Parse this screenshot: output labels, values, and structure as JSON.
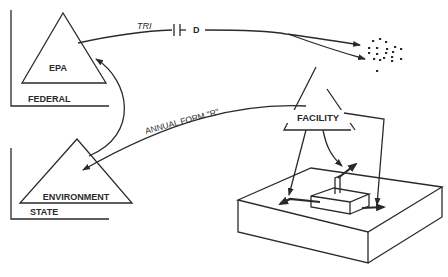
{
  "diagram": {
    "type": "flow-schematic",
    "nodes": {
      "federal": {
        "entity_label": "EPA",
        "level_label": "FEDERAL"
      },
      "state": {
        "entity_label": "ENVIRONMENT",
        "level_label": "STATE"
      },
      "facility": {
        "entity_label": "FACILITY"
      },
      "public": {
        "label": ""
      }
    },
    "edges": {
      "tri": {
        "label": "TRI",
        "suffix": "D",
        "from": "EPA",
        "to": "public (dots)"
      },
      "annual_form": {
        "label": "ANNUAL FORM \"R\"",
        "from": "FACILITY",
        "to": "ENVIRONMENT"
      },
      "epa_env": {
        "label": "",
        "from": "ENVIRONMENT",
        "to": "EPA"
      },
      "facility_releases": {
        "label": "",
        "from": "FACILITY",
        "to": "site (air, land, water)"
      }
    },
    "colors": {
      "ink": "#2a2a2a",
      "background": "#ffffff"
    }
  }
}
